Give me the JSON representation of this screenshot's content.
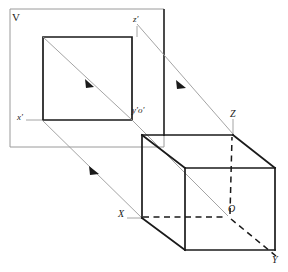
{
  "figure": {
    "plane_label": "V",
    "colors": {
      "solid_edge": "#1a1a1a",
      "hidden_edge": "#1a1a1a",
      "plane_outline": "#9a9a9a",
      "projection_ray": "#9a9a9a",
      "axis_line": "#9a9a9a",
      "background": "#ffffff",
      "label_text": "#1a1a1a"
    },
    "labels": [
      {
        "name": "plane-label-v",
        "text": "V",
        "x": 14,
        "y": 14,
        "style": "upright"
      },
      {
        "name": "axis-label-z-prime",
        "text": "z′",
        "x": 133,
        "y": 16,
        "style": "italic"
      },
      {
        "name": "axis-label-x-prime",
        "text": "x′",
        "x": 18,
        "y": 113,
        "style": "italic"
      },
      {
        "name": "axis-label-y-prime-o-prime",
        "text": "y′o′",
        "x": 132,
        "y": 107,
        "style": "italic"
      },
      {
        "name": "axis-label-z",
        "text": "Z",
        "x": 232,
        "y": 110,
        "style": "italic"
      },
      {
        "name": "axis-label-x",
        "text": "X",
        "x": 119,
        "y": 209,
        "style": "italic"
      },
      {
        "name": "axis-label-o",
        "text": "O",
        "x": 229,
        "y": 204,
        "style": "italic"
      },
      {
        "name": "axis-label-y",
        "text": "Y",
        "x": 272,
        "y": 255,
        "style": "italic"
      }
    ],
    "projection_plane": {
      "name": "vertical-projection-plane",
      "corners": [
        [
          10,
          9
        ],
        [
          164,
          9
        ],
        [
          164,
          147
        ],
        [
          10,
          147
        ]
      ],
      "right_edge_emphasis": {
        "x": 164,
        "y1": 9,
        "y2": 136
      }
    },
    "projected_square": {
      "name": "projected-square",
      "corners": [
        [
          43,
          37
        ],
        [
          132,
          37
        ],
        [
          132,
          120
        ],
        [
          43,
          120
        ]
      ],
      "diagonal": [
        [
          43,
          37
        ],
        [
          132,
          120
        ]
      ]
    },
    "cube": {
      "name": "cube-solid",
      "front_face": [
        [
          185,
          168
        ],
        [
          275,
          168
        ],
        [
          275,
          250
        ],
        [
          185,
          250
        ]
      ],
      "back_face": [
        [
          142,
          135
        ],
        [
          233,
          135
        ],
        [
          233,
          216
        ],
        [
          142,
          216
        ]
      ],
      "visible_edges": [
        [
          [
            142,
            135
          ],
          [
            233,
            135
          ]
        ],
        [
          [
            142,
            135
          ],
          [
            142,
            218
          ]
        ],
        [
          [
            142,
            135
          ],
          [
            185,
            168
          ]
        ],
        [
          [
            233,
            135
          ],
          [
            275,
            168
          ]
        ],
        [
          [
            185,
            168
          ],
          [
            275,
            168
          ]
        ],
        [
          [
            185,
            168
          ],
          [
            185,
            250
          ]
        ],
        [
          [
            275,
            168
          ],
          [
            275,
            250
          ]
        ],
        [
          [
            185,
            250
          ],
          [
            275,
            250
          ]
        ],
        [
          [
            142,
            218
          ],
          [
            185,
            250
          ]
        ]
      ],
      "hidden_edges": [
        [
          [
            142,
            216
          ],
          [
            228,
            216
          ]
        ],
        [
          [
            228,
            216
          ],
          [
            233,
            135
          ]
        ],
        [
          [
            228,
            216
          ],
          [
            278,
            258
          ]
        ]
      ]
    },
    "projection_rays": [
      {
        "name": "ray-z-prime-to-z",
        "from": [
          137,
          22
        ],
        "to": [
          233,
          135
        ],
        "arrow_at": [
          181,
          84
        ]
      },
      {
        "name": "ray-y-prime-to-o",
        "from": [
          132,
          120
        ],
        "to": [
          228,
          216
        ],
        "arrow_at": [
          182,
          170
        ]
      },
      {
        "name": "ray-x-prime-to-x",
        "from": [
          42,
          120
        ],
        "to": [
          142,
          218
        ],
        "arrow_at": [
          94,
          170
        ]
      },
      {
        "name": "ray-square-diagonal",
        "from": [
          43,
          37
        ],
        "to": [
          132,
          120
        ],
        "arrow_at": [
          89,
          83
        ]
      }
    ],
    "axis_tick_lines": [
      {
        "name": "tick-x-prime",
        "from": [
          26,
          120
        ],
        "to": [
          43,
          120
        ]
      },
      {
        "name": "tick-z-prime-vertical",
        "from": [
          137,
          26
        ],
        "to": [
          137,
          37
        ]
      },
      {
        "name": "tick-z-vertical",
        "from": [
          233,
          120
        ],
        "to": [
          233,
          135
        ]
      },
      {
        "name": "tick-x-horizontal",
        "from": [
          128,
          218
        ],
        "to": [
          142,
          218
        ]
      }
    ]
  }
}
